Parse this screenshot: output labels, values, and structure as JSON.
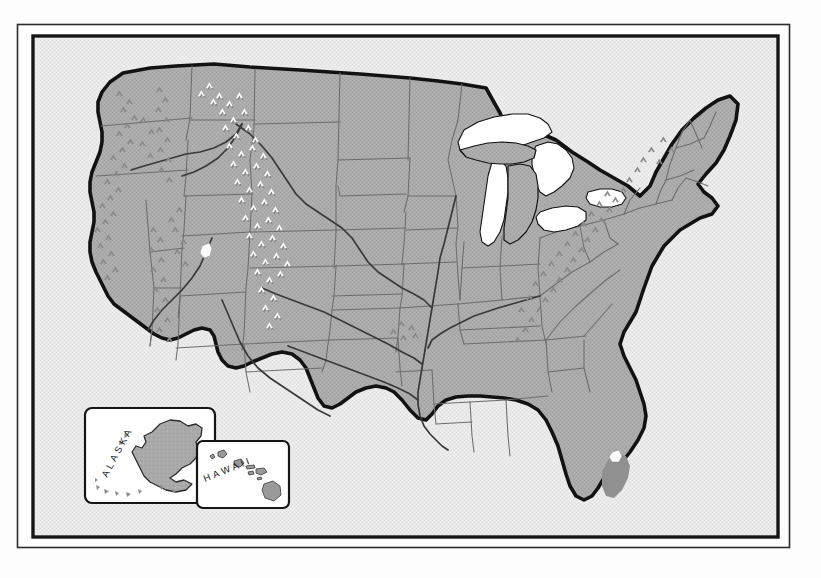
{
  "figure": {
    "kind": "reference-map",
    "frame": {
      "outer_line_color": "#1a1a1a",
      "inner_line_color": "#141414",
      "paper_color": "#fdfdfd"
    },
    "palette": {
      "ocean": "#e9e9e9",
      "land": "#a9a9a9",
      "land_shadow": "#9a9a9a",
      "lake_white": "#ffffff",
      "coastline": "#121212",
      "state_border": "#6e6e6e",
      "river": "#3a3a3a",
      "mountain_dark": "#8a8a8a",
      "mountain_white": "#fbfbfb",
      "mountain_shadow": "#848484",
      "everglades": "#8f8f8f",
      "inset_fill": "#ffffff",
      "inset_border": "#161616",
      "label_color": "#1a1a1a"
    }
  },
  "insets": [
    {
      "id": "alaska",
      "label": "ALASKA",
      "label_letters": [
        "A",
        "L",
        "A",
        "S",
        "K",
        "A"
      ],
      "label_rotation_deg": -62
    },
    {
      "id": "hawaii",
      "label": "HAWAII",
      "label_letters": [
        "H",
        "A",
        "W",
        "A",
        "I",
        "I"
      ],
      "label_rotation_deg": -22
    }
  ],
  "features": {
    "great_lakes": [
      "Lake Superior",
      "Lake Michigan",
      "Lake Huron",
      "Lake Erie",
      "Lake Ontario"
    ],
    "inland_water": [
      "Lake Okeechobee",
      "Great Salt Lake"
    ],
    "mountain_ranges_dark": [
      "Coast Ranges",
      "Cascade Range",
      "Sierra Nevada",
      "Appalachian Mountains",
      "Ozark Plateau"
    ],
    "mountain_ranges_white": [
      "Rocky Mountains",
      "Continental Divide"
    ],
    "rivers": [
      "Mississippi River",
      "Missouri River",
      "Ohio River",
      "Columbia River",
      "Rio Grande",
      "Colorado River",
      "Snake River",
      "Arkansas River",
      "Red River"
    ],
    "shaded_region": "Everglades"
  }
}
